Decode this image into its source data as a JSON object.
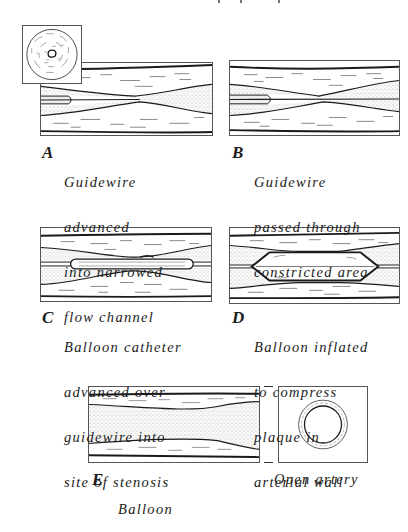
{
  "figure": {
    "panels": [
      {
        "id": "A",
        "letter": "A",
        "lines": [
          "Guidewire",
          "advanced",
          "into narrowed",
          "flow channel"
        ]
      },
      {
        "id": "B",
        "letter": "B",
        "lines": [
          "Guidewire",
          "passed through",
          "constricted area"
        ]
      },
      {
        "id": "C",
        "letter": "C",
        "lines": [
          "Balloon catheter",
          "advanced over",
          "guidewire into",
          "site of stenosis"
        ]
      },
      {
        "id": "D",
        "letter": "D",
        "lines": [
          "Balloon inflated",
          "to compress",
          "plaque in",
          "arterial wall"
        ]
      },
      {
        "id": "E",
        "letter": "E",
        "lines": [
          "Balloon",
          "withdrawn,",
          "arterial channel",
          "enlarged"
        ]
      }
    ],
    "inset_cross_section": {
      "label": "narrowed artery cross-section"
    },
    "open_artery": {
      "label": "Open artery"
    }
  },
  "colors": {
    "line": "#1a1a1a",
    "border": "#555555",
    "plaque_stipple": "#9a9a9a",
    "background": "#ffffff"
  }
}
